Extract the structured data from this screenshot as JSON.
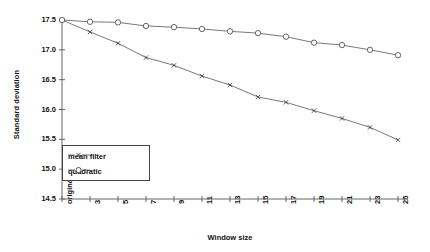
{
  "chart_data": {
    "type": "line",
    "title": "",
    "xlabel": "Window size",
    "ylabel": "Standard deviation",
    "categories": [
      "original",
      "3",
      "5",
      "7",
      "9",
      "11",
      "13",
      "15",
      "17",
      "19",
      "21",
      "23",
      "25"
    ],
    "ylim": [
      14.5,
      17.5
    ],
    "yticks": [
      "14.5",
      "15.0",
      "15.5",
      "16.0",
      "16.5",
      "17.0",
      "17.5"
    ],
    "ytick_values": [
      14.5,
      15.0,
      15.5,
      16.0,
      16.5,
      17.0,
      17.5
    ],
    "grid": false,
    "legend_position": "lower-left-inside",
    "series": [
      {
        "name": "mean filter",
        "marker": "x",
        "values": [
          17.5,
          17.3,
          17.11,
          16.87,
          16.74,
          16.56,
          16.41,
          16.21,
          16.12,
          15.98,
          15.85,
          15.7,
          15.49
        ]
      },
      {
        "name": "quadratic",
        "marker": "circle",
        "values": [
          17.5,
          17.47,
          17.46,
          17.4,
          17.38,
          17.35,
          17.31,
          17.28,
          17.22,
          17.12,
          17.08,
          17.0,
          16.91
        ]
      }
    ]
  },
  "legend": {
    "items": [
      {
        "label": "mean filter",
        "marker": "x"
      },
      {
        "label": "quadratic",
        "marker": "circle"
      }
    ]
  },
  "axes": {
    "y_title": "Standard deviation",
    "x_title": "Window size"
  },
  "colors": {
    "line": "#555555",
    "text": "#111111",
    "axis": "#666666",
    "background": "#ffffff"
  }
}
